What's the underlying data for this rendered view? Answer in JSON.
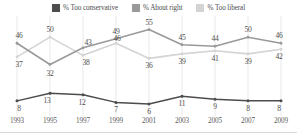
{
  "legend": {
    "items": [
      {
        "label": "% Too conservative",
        "color": "#4d4d4d",
        "swatch_name": "legend-swatch-too-conservative"
      },
      {
        "label": "% About right",
        "color": "#9a9a9a",
        "swatch_name": "legend-swatch-about-right"
      },
      {
        "label": "% Too liberal",
        "color": "#d4d4d4",
        "swatch_name": "legend-swatch-too-liberal"
      }
    ]
  },
  "chart_data": {
    "type": "line",
    "title": "",
    "subtitle": "",
    "xlabel": "",
    "ylabel": "",
    "x": [
      1993,
      1995,
      1997,
      1999,
      2001,
      2003,
      2005,
      2007,
      2009
    ],
    "categories": [
      "1993",
      "1995",
      "1997",
      "1999",
      "2001",
      "2003",
      "2005",
      "2007",
      "2009"
    ],
    "ylim": [
      0,
      60
    ],
    "xlim": [
      1993,
      2009
    ],
    "grid": "vertical",
    "legend_position": "top-center",
    "series": [
      {
        "name": "% Too conservative",
        "color": "#4d4d4d",
        "values": [
          8,
          13,
          12,
          7,
          6,
          11,
          9,
          8,
          8
        ],
        "label_positions": [
          "below",
          "below",
          "below",
          "below",
          "below",
          "below",
          "below",
          "below",
          "below"
        ]
      },
      {
        "name": "% About right",
        "color": "#9a9a9a",
        "values": [
          46,
          32,
          43,
          49,
          55,
          45,
          44,
          50,
          46
        ],
        "label_positions": [
          "above",
          "below",
          "above",
          "above",
          "above",
          "above",
          "above",
          "above",
          "above"
        ]
      },
      {
        "name": "% Too liberal",
        "color": "#d4d4d4",
        "values": [
          37,
          50,
          38,
          46,
          36,
          39,
          41,
          39,
          42
        ],
        "label_positions": [
          "below",
          "above",
          "below",
          "above",
          "below",
          "below",
          "below",
          "below",
          "below"
        ]
      }
    ]
  }
}
